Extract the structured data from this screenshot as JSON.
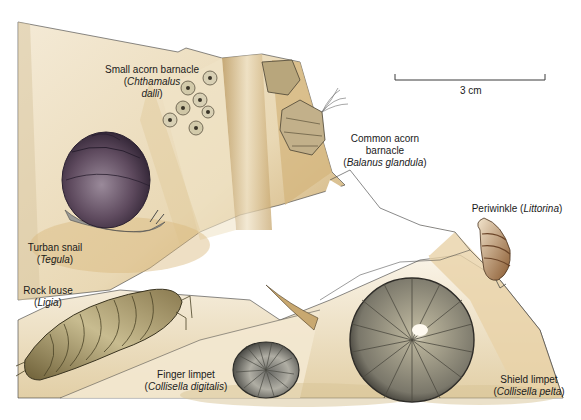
{
  "figure": {
    "colors": {
      "background": "#ffffff",
      "rock_sand": "#e8d7b4",
      "rock_shadow": "#b8975e",
      "rock_outline": "#3a3a3a",
      "turban_snail_shell": "#5e4a5e",
      "snail_foot": "#9a9a96",
      "rock_louse": "#a89868",
      "limpet_gray": "#7a776a",
      "periwinkle": "#a07a50",
      "barnacle": "#c8c0a0"
    },
    "scale_bar": {
      "label": "3 cm"
    },
    "labels": [
      {
        "id": "small-acorn-barnacle",
        "common": "Small acorn barnacle",
        "sci_open": "(",
        "scientific": "Chthamalus",
        "scientific2": "dalli",
        "sci_close": ")"
      },
      {
        "id": "common-acorn-barnacle",
        "common": "Common acorn",
        "common2": "barnacle",
        "sci_open": "(",
        "scientific": "Balanus glandula",
        "sci_close": ")"
      },
      {
        "id": "periwinkle",
        "common": "Periwinkle (",
        "scientific": "Littorina",
        "sci_close": ")"
      },
      {
        "id": "turban-snail",
        "common": "Turban snail",
        "sci_open": "(",
        "scientific": "Tegula",
        "sci_close": ")"
      },
      {
        "id": "rock-louse",
        "common": "Rock louse",
        "sci_open": "(",
        "scientific": "Ligia",
        "sci_close": ")"
      },
      {
        "id": "finger-limpet",
        "common": "Finger limpet",
        "sci_open": "(",
        "scientific": "Collisella digitalis",
        "sci_close": ")"
      },
      {
        "id": "shield-limpet",
        "common": "Shield limpet",
        "sci_open": "(",
        "scientific": "Collisella pelta",
        "sci_close": ")"
      }
    ]
  }
}
